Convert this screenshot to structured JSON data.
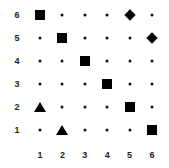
{
  "grid": {
    "rows": [
      "6",
      "5",
      "4",
      "3",
      "2",
      "1"
    ],
    "columns": [
      "1",
      "2",
      "3",
      "4",
      "5",
      "6"
    ],
    "default_marker": "dot",
    "markers": [
      {
        "col": 1,
        "row": 6,
        "shape": "square"
      },
      {
        "col": 2,
        "row": 5,
        "shape": "square"
      },
      {
        "col": 3,
        "row": 4,
        "shape": "square"
      },
      {
        "col": 4,
        "row": 3,
        "shape": "square"
      },
      {
        "col": 5,
        "row": 2,
        "shape": "square"
      },
      {
        "col": 6,
        "row": 1,
        "shape": "square"
      },
      {
        "col": 5,
        "row": 6,
        "shape": "diamond"
      },
      {
        "col": 6,
        "row": 5,
        "shape": "diamond"
      },
      {
        "col": 1,
        "row": 2,
        "shape": "triangle"
      },
      {
        "col": 2,
        "row": 1,
        "shape": "triangle"
      }
    ],
    "marker_color": "#000000"
  }
}
